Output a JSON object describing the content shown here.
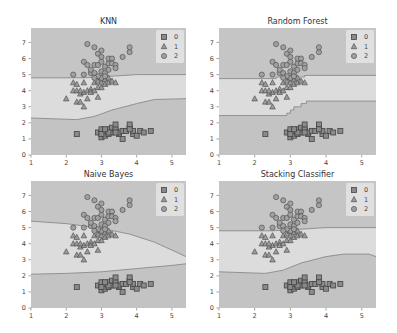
{
  "figure": {
    "width": 397,
    "height": 333,
    "colors": {
      "region_0": "#c3c3c3",
      "region_1": "#dcdcdc",
      "region_2": "#c5c5c5",
      "boundary": "#8a8a8a",
      "marker_fill_0": "#8a8a8a",
      "marker_fill_1": "#9a9a9a",
      "marker_fill_2": "#a0a0a0",
      "marker_edge": "#444444",
      "legend_bg": "#e6e6e6"
    }
  },
  "chart_data": [
    {
      "type": "scatter",
      "title": "KNN",
      "xlim": [
        1,
        5.4
      ],
      "ylim": [
        0,
        7.9
      ],
      "xticks": [
        1,
        2,
        3,
        4,
        5
      ],
      "yticks": [
        0,
        1,
        2,
        3,
        4,
        5,
        6,
        7
      ],
      "legend": [
        "0",
        "1",
        "2"
      ],
      "legend_position": "upper right",
      "boundaries": {
        "upper": [
          [
            1,
            4.8
          ],
          [
            2.5,
            4.8
          ],
          [
            3.3,
            4.9
          ],
          [
            4,
            5.0
          ],
          [
            5.4,
            5.0
          ]
        ],
        "lower": [
          [
            1,
            2.3
          ],
          [
            2.3,
            2.2
          ],
          [
            2.8,
            2.4
          ],
          [
            3.3,
            2.8
          ],
          [
            4,
            3.2
          ],
          [
            4.5,
            3.45
          ],
          [
            5.4,
            3.5
          ]
        ]
      }
    },
    {
      "type": "scatter",
      "title": "Random Forest",
      "xlim": [
        1,
        5.4
      ],
      "ylim": [
        0,
        7.9
      ],
      "xticks": [
        1,
        2,
        3,
        4,
        5
      ],
      "yticks": [
        0,
        1,
        2,
        3,
        4,
        5,
        6,
        7
      ],
      "legend": [
        "0",
        "1",
        "2"
      ],
      "legend_position": "upper right",
      "boundaries": {
        "upper": [
          [
            1,
            4.75
          ],
          [
            2.6,
            4.75
          ],
          [
            2.6,
            4.85
          ],
          [
            3.4,
            4.85
          ],
          [
            3.4,
            4.95
          ],
          [
            5.4,
            4.95
          ]
        ],
        "lower": [
          [
            1,
            2.45
          ],
          [
            2.9,
            2.45
          ],
          [
            2.9,
            2.6
          ],
          [
            3.0,
            2.6
          ],
          [
            3.0,
            2.8
          ],
          [
            3.1,
            2.8
          ],
          [
            3.1,
            3.0
          ],
          [
            3.3,
            3.0
          ],
          [
            3.3,
            3.2
          ],
          [
            3.45,
            3.2
          ],
          [
            3.45,
            3.35
          ],
          [
            5.4,
            3.35
          ]
        ]
      }
    },
    {
      "type": "scatter",
      "title": "Naive Bayes",
      "xlim": [
        1,
        5.4
      ],
      "ylim": [
        0,
        7.9
      ],
      "xticks": [
        1,
        2,
        3,
        4,
        5
      ],
      "yticks": [
        0,
        1,
        2,
        3,
        4,
        5,
        6,
        7
      ],
      "legend": [
        "0",
        "1",
        "2"
      ],
      "legend_position": "upper right",
      "boundaries": {
        "upper": [
          [
            1,
            5.4
          ],
          [
            2,
            5.25
          ],
          [
            3,
            4.95
          ],
          [
            3.8,
            4.6
          ],
          [
            4.5,
            4.1
          ],
          [
            5,
            3.6
          ],
          [
            5.4,
            3.2
          ]
        ],
        "lower": [
          [
            1,
            2.1
          ],
          [
            2,
            2.15
          ],
          [
            3,
            2.25
          ],
          [
            4,
            2.45
          ],
          [
            5,
            2.65
          ],
          [
            5.4,
            2.75
          ]
        ]
      }
    },
    {
      "type": "scatter",
      "title": "Stacking Classifier",
      "xlim": [
        1,
        5.4
      ],
      "ylim": [
        0,
        7.9
      ],
      "xticks": [
        1,
        2,
        3,
        4,
        5
      ],
      "yticks": [
        0,
        1,
        2,
        3,
        4,
        5,
        6,
        7
      ],
      "legend": [
        "0",
        "1",
        "2"
      ],
      "legend_position": "upper right",
      "boundaries": {
        "upper": [
          [
            1,
            4.8
          ],
          [
            2.5,
            4.8
          ],
          [
            3.3,
            4.9
          ],
          [
            4,
            5.0
          ],
          [
            5.4,
            5.0
          ]
        ],
        "lower": [
          [
            1,
            2.25
          ],
          [
            2.3,
            2.15
          ],
          [
            2.8,
            2.35
          ],
          [
            3.3,
            2.8
          ],
          [
            4,
            3.2
          ],
          [
            4.5,
            3.35
          ],
          [
            5.2,
            3.35
          ],
          [
            5.4,
            3.2
          ]
        ]
      }
    }
  ],
  "points": {
    "class_0": [
      [
        2.3,
        1.3
      ],
      [
        2.9,
        1.4
      ],
      [
        3.0,
        1.1
      ],
      [
        3.0,
        1.4
      ],
      [
        3.0,
        1.6
      ],
      [
        3.1,
        1.2
      ],
      [
        3.1,
        1.5
      ],
      [
        3.2,
        1.3
      ],
      [
        3.2,
        1.6
      ],
      [
        3.3,
        1.4
      ],
      [
        3.3,
        1.7
      ],
      [
        3.4,
        1.5
      ],
      [
        3.4,
        1.6
      ],
      [
        3.4,
        1.9
      ],
      [
        3.5,
        1.3
      ],
      [
        3.5,
        1.4
      ],
      [
        3.6,
        1.0
      ],
      [
        3.6,
        1.5
      ],
      [
        3.7,
        1.5
      ],
      [
        3.8,
        1.7
      ],
      [
        3.8,
        1.9
      ],
      [
        3.9,
        1.3
      ],
      [
        3.9,
        1.5
      ],
      [
        4.0,
        1.2
      ],
      [
        4.1,
        1.5
      ],
      [
        4.2,
        1.4
      ],
      [
        4.4,
        1.5
      ],
      [
        3.0,
        1.3
      ],
      [
        3.2,
        1.4
      ],
      [
        3.4,
        1.4
      ],
      [
        3.1,
        1.6
      ],
      [
        3.8,
        1.6
      ]
    ],
    "class_1": [
      [
        2.0,
        3.5
      ],
      [
        2.2,
        4.0
      ],
      [
        2.2,
        4.5
      ],
      [
        2.3,
        4.0
      ],
      [
        2.3,
        4.4
      ],
      [
        2.3,
        3.3
      ],
      [
        2.4,
        3.3
      ],
      [
        2.4,
        3.8
      ],
      [
        2.5,
        3.0
      ],
      [
        2.5,
        3.9
      ],
      [
        2.5,
        4.5
      ],
      [
        2.6,
        4.0
      ],
      [
        2.6,
        3.5
      ],
      [
        2.7,
        4.1
      ],
      [
        2.7,
        3.9
      ],
      [
        2.8,
        4.0
      ],
      [
        2.8,
        4.5
      ],
      [
        2.9,
        4.2
      ],
      [
        2.9,
        3.6
      ],
      [
        2.9,
        4.6
      ],
      [
        3.0,
        4.2
      ],
      [
        3.0,
        4.5
      ],
      [
        3.0,
        4.8
      ],
      [
        3.1,
        4.4
      ],
      [
        3.1,
        4.7
      ],
      [
        3.2,
        4.5
      ],
      [
        3.2,
        4.8
      ],
      [
        3.3,
        4.6
      ],
      [
        3.4,
        4.5
      ],
      [
        2.4,
        4.0
      ]
    ],
    "class_2": [
      [
        2.2,
        5.0
      ],
      [
        2.5,
        5.8
      ],
      [
        2.5,
        5.0
      ],
      [
        2.6,
        6.9
      ],
      [
        2.6,
        5.6
      ],
      [
        2.7,
        5.1
      ],
      [
        2.7,
        5.3
      ],
      [
        2.8,
        6.7
      ],
      [
        2.8,
        5.6
      ],
      [
        2.8,
        5.1
      ],
      [
        2.9,
        6.3
      ],
      [
        2.9,
        5.6
      ],
      [
        3.0,
        6.5
      ],
      [
        3.0,
        5.8
      ],
      [
        3.0,
        5.2
      ],
      [
        3.0,
        4.8
      ],
      [
        3.0,
        6.1
      ],
      [
        3.1,
        5.5
      ],
      [
        3.1,
        5.1
      ],
      [
        3.2,
        5.7
      ],
      [
        3.2,
        6.0
      ],
      [
        3.2,
        5.3
      ],
      [
        3.3,
        6.0
      ],
      [
        3.3,
        5.7
      ],
      [
        3.4,
        5.6
      ],
      [
        3.4,
        5.4
      ],
      [
        3.6,
        6.1
      ],
      [
        3.8,
        6.4
      ],
      [
        3.8,
        6.7
      ],
      [
        2.9,
        4.9
      ],
      [
        2.8,
        4.8
      ],
      [
        3.1,
        4.9
      ]
    ]
  },
  "layout": {
    "panels": [
      {
        "x0": 31,
        "x1": 186,
        "ytop": 28,
        "ybot": 155
      },
      {
        "x0": 219,
        "x1": 376,
        "ytop": 28,
        "ybot": 155
      },
      {
        "x0": 31,
        "x1": 186,
        "ytop": 181,
        "ybot": 308
      },
      {
        "x0": 219,
        "x1": 376,
        "ytop": 181,
        "ybot": 308
      }
    ]
  }
}
